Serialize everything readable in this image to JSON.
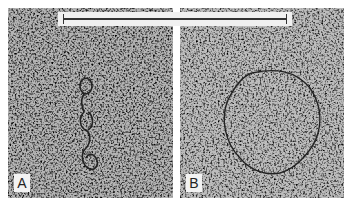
{
  "figure": {
    "panels": [
      {
        "label": "A",
        "content": "electron micrograph of twisted/looped DNA strand"
      },
      {
        "label": "B",
        "content": "electron micrograph of relaxed circular DNA molecule"
      }
    ],
    "scale_bar": {
      "label": ""
    }
  }
}
